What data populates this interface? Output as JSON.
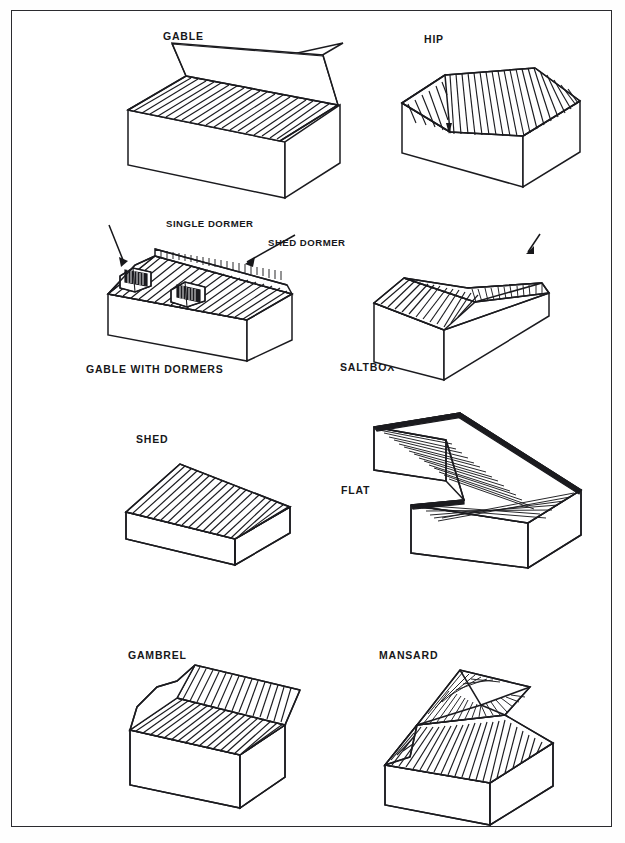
{
  "plate": {
    "title": "Roof Types",
    "background_color": "#ffffff",
    "border_color": "#2b2b2f",
    "ink_color": "#1b1b1f"
  },
  "figures": [
    {
      "id": "gable",
      "label": "GABLE",
      "row": 1,
      "column": "left",
      "description": "Simple two-slope roof with triangular gable ends"
    },
    {
      "id": "hip",
      "label": "HIP",
      "row": 1,
      "column": "right",
      "description": "Roof sloping on all four sides meeting at a ridge"
    },
    {
      "id": "gable-with-dormers",
      "label": "GABLE WITH DORMERS",
      "row": 2,
      "column": "left",
      "description": "Gable roof with projecting dormer windows"
    },
    {
      "id": "saltbox",
      "label": "SALTBOX",
      "row": 2,
      "column": "right",
      "description": "Asymmetric gable with one long rear slope"
    },
    {
      "id": "shed",
      "label": "SHED",
      "row": 3,
      "column": "left",
      "description": "Single sloping plane roof"
    },
    {
      "id": "flat",
      "label": "FLAT",
      "row": 3,
      "column": "right",
      "description": "Level roof deck on an L-shaped building"
    },
    {
      "id": "gambrel",
      "label": "GAMBREL",
      "row": 4,
      "column": "left",
      "description": "Two-pitch barn roof with steep lower slope"
    },
    {
      "id": "mansard",
      "label": "MANSARD",
      "row": 4,
      "column": "right",
      "description": "Steep lower slope with shallow hipped upper deck"
    }
  ],
  "callouts": [
    {
      "id": "single-dormer",
      "label": "SINGLE DORMER",
      "belongs_to": "gable-with-dormers"
    },
    {
      "id": "shed-dormer",
      "label": "SHED DORMER",
      "belongs_to": "gable-with-dormers"
    }
  ]
}
